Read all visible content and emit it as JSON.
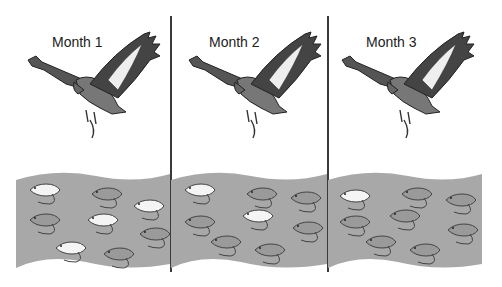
{
  "diagram": {
    "panels": [
      {
        "label": "Month 1",
        "white_mice": 4,
        "gray_mice": 4
      },
      {
        "label": "Month 2",
        "white_mice": 2,
        "gray_mice": 6
      },
      {
        "label": "Month 3",
        "white_mice": 1,
        "gray_mice": 7
      }
    ],
    "colors": {
      "field": "#a8a8a8",
      "white_mouse": "#f4f4f4",
      "gray_mouse": "#9a9a9a",
      "outline": "#444444",
      "divider": "#3a3a3a"
    }
  }
}
